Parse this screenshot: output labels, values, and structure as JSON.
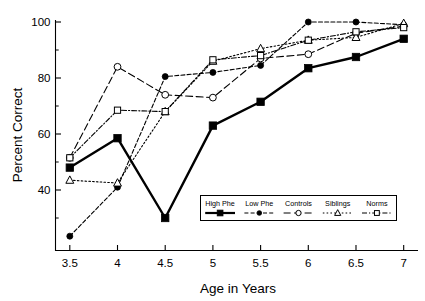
{
  "chart_data": {
    "type": "line",
    "title": "",
    "xlabel": "Age in Years",
    "ylabel": "Percent Correct",
    "x": [
      3.5,
      4,
      4.5,
      5,
      5.5,
      6,
      6.5,
      7
    ],
    "xticklabels": [
      "3.5",
      "4",
      "4.5",
      "5",
      "5.5",
      "6",
      "6.5",
      "7"
    ],
    "xlim": [
      3.35,
      7.15
    ],
    "ylim": [
      20,
      102
    ],
    "yticks": [
      40,
      60,
      80,
      100
    ],
    "yticklabels": [
      "40",
      "60",
      "80",
      "100"
    ],
    "yminorticks": [
      30,
      50,
      70,
      90
    ],
    "grid": false,
    "legend_position": "lower-right-inside",
    "series": [
      {
        "name": "High Phe",
        "marker": "filled-square",
        "linestyle": "solid",
        "linewidth": 2.4,
        "values": [
          48,
          58.5,
          30,
          63,
          71.5,
          83.5,
          87.5,
          94
        ]
      },
      {
        "name": "Low Phe",
        "marker": "filled-circle",
        "linestyle": "dashed-dotted",
        "linewidth": 1.1,
        "values": [
          23.5,
          41,
          80.5,
          82,
          84.5,
          100,
          100,
          99
        ]
      },
      {
        "name": "Controls",
        "marker": "open-circle",
        "linestyle": "dashed",
        "linewidth": 1.1,
        "values": [
          51.5,
          84,
          74,
          73,
          87,
          88.5,
          96,
          98.5
        ]
      },
      {
        "name": "Siblings",
        "marker": "open-triangle",
        "linestyle": "dotted",
        "linewidth": 1.1,
        "values": [
          43.5,
          42.5,
          68,
          86,
          90.5,
          93.5,
          94.5,
          99.5
        ]
      },
      {
        "name": "Norms",
        "marker": "open-square",
        "linestyle": "dash-dot-fine",
        "linewidth": 1.1,
        "values": [
          51.5,
          68.5,
          68,
          86.5,
          88,
          93.5,
          96.5,
          98
        ]
      }
    ]
  },
  "legend": {
    "entries": [
      {
        "label": "High Phe",
        "marker": "filled-square",
        "linestyle": "solid"
      },
      {
        "label": "Low Phe",
        "marker": "filled-circle",
        "linestyle": "dashed-dotted"
      },
      {
        "label": "Controls",
        "marker": "open-circle",
        "linestyle": "dashed"
      },
      {
        "label": "Siblings",
        "marker": "open-triangle",
        "linestyle": "dotted"
      },
      {
        "label": "Norms",
        "marker": "open-square",
        "linestyle": "dash-dot-fine"
      }
    ]
  },
  "colors": {
    "foreground": "#000000",
    "background": "#ffffff",
    "axis": "#000000",
    "marker_fill_open": "#ffffff"
  }
}
